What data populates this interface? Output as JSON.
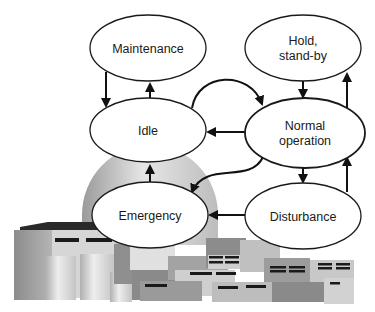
{
  "diagram": {
    "type": "state-transition",
    "background_illustration": "nuclear-power-plant",
    "nodes": [
      {
        "id": "maintenance",
        "label_lines": [
          "Maintenance"
        ],
        "cx": 148,
        "cy": 48,
        "rx": 58,
        "ry": 33
      },
      {
        "id": "hold",
        "label_lines": [
          "Hold,",
          "stand-by"
        ],
        "cx": 303,
        "cy": 48,
        "rx": 58,
        "ry": 33
      },
      {
        "id": "idle",
        "label_lines": [
          "Idle"
        ],
        "cx": 148,
        "cy": 130,
        "rx": 58,
        "ry": 32
      },
      {
        "id": "normal",
        "label_lines": [
          "Normal",
          "operation"
        ],
        "cx": 305,
        "cy": 133,
        "rx": 60,
        "ry": 35
      },
      {
        "id": "emergency",
        "label_lines": [
          "Emergency"
        ],
        "cx": 150,
        "cy": 215,
        "rx": 58,
        "ry": 33
      },
      {
        "id": "disturbance",
        "label_lines": [
          "Disturbance"
        ],
        "cx": 303,
        "cy": 216,
        "rx": 58,
        "ry": 33
      }
    ],
    "edges": [
      {
        "from": "maintenance",
        "to": "idle"
      },
      {
        "from": "idle",
        "to": "maintenance"
      },
      {
        "from": "idle",
        "to": "normal"
      },
      {
        "from": "normal",
        "to": "idle"
      },
      {
        "from": "hold",
        "to": "normal"
      },
      {
        "from": "normal",
        "to": "hold"
      },
      {
        "from": "normal",
        "to": "emergency"
      },
      {
        "from": "normal",
        "to": "disturbance"
      },
      {
        "from": "disturbance",
        "to": "normal"
      },
      {
        "from": "disturbance",
        "to": "emergency"
      },
      {
        "from": "emergency",
        "to": "idle"
      }
    ]
  },
  "labels": {
    "maintenance": "Maintenance",
    "hold_1": "Hold,",
    "hold_2": "stand-by",
    "idle": "Idle",
    "normal_1": "Normal",
    "normal_2": "operation",
    "emergency": "Emergency",
    "disturbance": "Disturbance"
  },
  "colors": {
    "stroke": "#1a1a1a",
    "ellipse_fill": "#ffffff",
    "building_light": "#d9d9d9",
    "building_mid": "#a6a6a6",
    "building_dark": "#7a7a7a",
    "window": "#1a1a1a"
  }
}
